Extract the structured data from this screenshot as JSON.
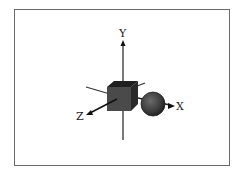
{
  "diagram": {
    "type": "3d-coordinate-axes",
    "axes": [
      {
        "name": "x-axis",
        "label": "X"
      },
      {
        "name": "y-axis",
        "label": "Y"
      },
      {
        "name": "z-axis",
        "label": "Z"
      }
    ],
    "objects": [
      {
        "name": "cube",
        "shape": "cube",
        "color": "#3a3a3a"
      },
      {
        "name": "sphere",
        "shape": "sphere",
        "color": "#3c3c3c"
      }
    ]
  }
}
